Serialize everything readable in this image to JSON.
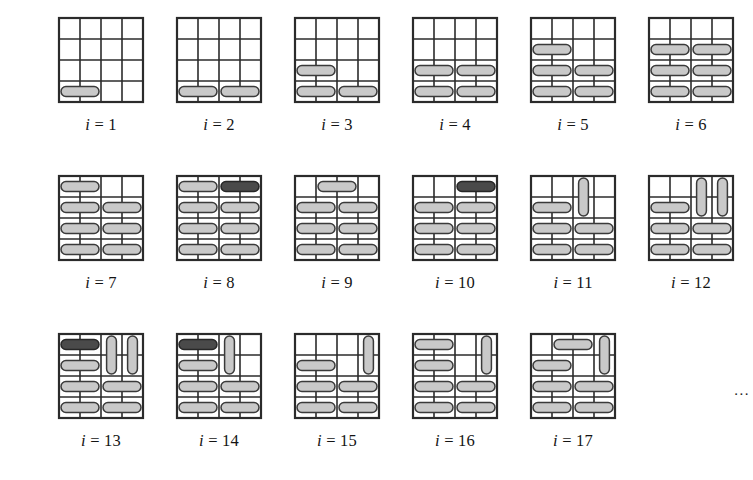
{
  "figure": {
    "grid": {
      "rows": 4,
      "cols": 4,
      "cell_size": 21,
      "line_color": "#2b2b2b",
      "line_width": 1.6,
      "border_width": 2.2,
      "background": "#ffffff"
    },
    "colors": {
      "domino_light_fill": "#c9c9c9",
      "domino_light_stroke": "#3a3a3a",
      "domino_dark_fill": "#4a4a4a",
      "domino_dark_stroke": "#262626",
      "grid_line": "#2b2b2b",
      "text": "#141414",
      "page_background": "#ffffff"
    },
    "label_prefix": "i",
    "label_separator": "=",
    "continuation": "...",
    "layout": {
      "rows": [
        {
          "top": 14,
          "left": 42,
          "gap": 118
        },
        {
          "top": 172,
          "left": 42,
          "gap": 118
        },
        {
          "top": 330,
          "left": 42,
          "gap": 118
        }
      ]
    },
    "panels": [
      {
        "id": "panel-1",
        "index": 1,
        "label": "i = 1",
        "label_value": "1",
        "domino_count": 1,
        "dominoes": [
          {
            "row": 4,
            "col": 1,
            "orient": "h",
            "shade": "light"
          }
        ]
      },
      {
        "id": "panel-2",
        "index": 2,
        "label": "i = 2",
        "label_value": "2",
        "domino_count": 2,
        "dominoes": [
          {
            "row": 4,
            "col": 1,
            "orient": "h",
            "shade": "light"
          },
          {
            "row": 4,
            "col": 3,
            "orient": "h",
            "shade": "light"
          }
        ]
      },
      {
        "id": "panel-3",
        "index": 3,
        "label": "i = 3",
        "label_value": "3",
        "domino_count": 3,
        "dominoes": [
          {
            "row": 3,
            "col": 1,
            "orient": "h",
            "shade": "light"
          },
          {
            "row": 4,
            "col": 1,
            "orient": "h",
            "shade": "light"
          },
          {
            "row": 4,
            "col": 3,
            "orient": "h",
            "shade": "light"
          }
        ]
      },
      {
        "id": "panel-4",
        "index": 4,
        "label": "i = 4",
        "label_value": "4",
        "domino_count": 4,
        "dominoes": [
          {
            "row": 3,
            "col": 1,
            "orient": "h",
            "shade": "light"
          },
          {
            "row": 3,
            "col": 3,
            "orient": "h",
            "shade": "light"
          },
          {
            "row": 4,
            "col": 1,
            "orient": "h",
            "shade": "light"
          },
          {
            "row": 4,
            "col": 3,
            "orient": "h",
            "shade": "light"
          }
        ]
      },
      {
        "id": "panel-5",
        "index": 5,
        "label": "i = 5",
        "label_value": "5",
        "domino_count": 5,
        "dominoes": [
          {
            "row": 2,
            "col": 1,
            "orient": "h",
            "shade": "light"
          },
          {
            "row": 3,
            "col": 1,
            "orient": "h",
            "shade": "light"
          },
          {
            "row": 3,
            "col": 3,
            "orient": "h",
            "shade": "light"
          },
          {
            "row": 4,
            "col": 1,
            "orient": "h",
            "shade": "light"
          },
          {
            "row": 4,
            "col": 3,
            "orient": "h",
            "shade": "light"
          }
        ]
      },
      {
        "id": "panel-6",
        "index": 6,
        "label": "i = 6",
        "label_value": "6",
        "domino_count": 6,
        "dominoes": [
          {
            "row": 2,
            "col": 1,
            "orient": "h",
            "shade": "light"
          },
          {
            "row": 2,
            "col": 3,
            "orient": "h",
            "shade": "light"
          },
          {
            "row": 3,
            "col": 1,
            "orient": "h",
            "shade": "light"
          },
          {
            "row": 3,
            "col": 3,
            "orient": "h",
            "shade": "light"
          },
          {
            "row": 4,
            "col": 1,
            "orient": "h",
            "shade": "light"
          },
          {
            "row": 4,
            "col": 3,
            "orient": "h",
            "shade": "light"
          }
        ]
      },
      {
        "id": "panel-7",
        "index": 7,
        "label": "i = 7",
        "label_value": "7",
        "domino_count": 7,
        "dominoes": [
          {
            "row": 1,
            "col": 1,
            "orient": "h",
            "shade": "light"
          },
          {
            "row": 2,
            "col": 1,
            "orient": "h",
            "shade": "light"
          },
          {
            "row": 2,
            "col": 3,
            "orient": "h",
            "shade": "light"
          },
          {
            "row": 3,
            "col": 1,
            "orient": "h",
            "shade": "light"
          },
          {
            "row": 3,
            "col": 3,
            "orient": "h",
            "shade": "light"
          },
          {
            "row": 4,
            "col": 1,
            "orient": "h",
            "shade": "light"
          },
          {
            "row": 4,
            "col": 3,
            "orient": "h",
            "shade": "light"
          }
        ]
      },
      {
        "id": "panel-8",
        "index": 8,
        "label": "i = 8",
        "label_value": "8",
        "domino_count": 8,
        "dominoes": [
          {
            "row": 1,
            "col": 1,
            "orient": "h",
            "shade": "light"
          },
          {
            "row": 1,
            "col": 3,
            "orient": "h",
            "shade": "dark"
          },
          {
            "row": 2,
            "col": 1,
            "orient": "h",
            "shade": "light"
          },
          {
            "row": 2,
            "col": 3,
            "orient": "h",
            "shade": "light"
          },
          {
            "row": 3,
            "col": 1,
            "orient": "h",
            "shade": "light"
          },
          {
            "row": 3,
            "col": 3,
            "orient": "h",
            "shade": "light"
          },
          {
            "row": 4,
            "col": 1,
            "orient": "h",
            "shade": "light"
          },
          {
            "row": 4,
            "col": 3,
            "orient": "h",
            "shade": "light"
          }
        ]
      },
      {
        "id": "panel-9",
        "index": 9,
        "label": "i = 9",
        "label_value": "9",
        "domino_count": 7,
        "dominoes": [
          {
            "row": 1,
            "col": 2,
            "orient": "h",
            "shade": "light"
          },
          {
            "row": 2,
            "col": 1,
            "orient": "h",
            "shade": "light"
          },
          {
            "row": 2,
            "col": 3,
            "orient": "h",
            "shade": "light"
          },
          {
            "row": 3,
            "col": 1,
            "orient": "h",
            "shade": "light"
          },
          {
            "row": 3,
            "col": 3,
            "orient": "h",
            "shade": "light"
          },
          {
            "row": 4,
            "col": 1,
            "orient": "h",
            "shade": "light"
          },
          {
            "row": 4,
            "col": 3,
            "orient": "h",
            "shade": "light"
          }
        ]
      },
      {
        "id": "panel-10",
        "index": 10,
        "label": "i = 10",
        "label_value": "10",
        "domino_count": 7,
        "dominoes": [
          {
            "row": 1,
            "col": 3,
            "orient": "h",
            "shade": "dark"
          },
          {
            "row": 2,
            "col": 1,
            "orient": "h",
            "shade": "light"
          },
          {
            "row": 2,
            "col": 3,
            "orient": "h",
            "shade": "light"
          },
          {
            "row": 3,
            "col": 1,
            "orient": "h",
            "shade": "light"
          },
          {
            "row": 3,
            "col": 3,
            "orient": "h",
            "shade": "light"
          },
          {
            "row": 4,
            "col": 1,
            "orient": "h",
            "shade": "light"
          },
          {
            "row": 4,
            "col": 3,
            "orient": "h",
            "shade": "light"
          }
        ]
      },
      {
        "id": "panel-11",
        "index": 11,
        "label": "i = 11",
        "label_value": "11",
        "domino_count": 6,
        "dominoes": [
          {
            "row": 1,
            "col": 3,
            "orient": "v",
            "shade": "light"
          },
          {
            "row": 2,
            "col": 1,
            "orient": "h",
            "shade": "light"
          },
          {
            "row": 3,
            "col": 1,
            "orient": "h",
            "shade": "light"
          },
          {
            "row": 3,
            "col": 3,
            "orient": "h",
            "shade": "light"
          },
          {
            "row": 4,
            "col": 1,
            "orient": "h",
            "shade": "light"
          },
          {
            "row": 4,
            "col": 3,
            "orient": "h",
            "shade": "light"
          }
        ]
      },
      {
        "id": "panel-12",
        "index": 12,
        "label": "i = 12",
        "label_value": "12",
        "domino_count": 7,
        "dominoes": [
          {
            "row": 1,
            "col": 3,
            "orient": "v",
            "shade": "light"
          },
          {
            "row": 1,
            "col": 4,
            "orient": "v",
            "shade": "light"
          },
          {
            "row": 2,
            "col": 1,
            "orient": "h",
            "shade": "light"
          },
          {
            "row": 3,
            "col": 1,
            "orient": "h",
            "shade": "light"
          },
          {
            "row": 3,
            "col": 3,
            "orient": "h",
            "shade": "light"
          },
          {
            "row": 4,
            "col": 1,
            "orient": "h",
            "shade": "light"
          },
          {
            "row": 4,
            "col": 3,
            "orient": "h",
            "shade": "light"
          }
        ]
      },
      {
        "id": "panel-13",
        "index": 13,
        "label": "i = 13",
        "label_value": "13",
        "domino_count": 8,
        "dominoes": [
          {
            "row": 1,
            "col": 1,
            "orient": "h",
            "shade": "dark"
          },
          {
            "row": 1,
            "col": 3,
            "orient": "v",
            "shade": "light"
          },
          {
            "row": 1,
            "col": 4,
            "orient": "v",
            "shade": "light"
          },
          {
            "row": 2,
            "col": 1,
            "orient": "h",
            "shade": "light"
          },
          {
            "row": 3,
            "col": 1,
            "orient": "h",
            "shade": "light"
          },
          {
            "row": 3,
            "col": 3,
            "orient": "h",
            "shade": "light"
          },
          {
            "row": 4,
            "col": 1,
            "orient": "h",
            "shade": "light"
          },
          {
            "row": 4,
            "col": 3,
            "orient": "h",
            "shade": "light"
          }
        ]
      },
      {
        "id": "panel-14",
        "index": 14,
        "label": "i = 14",
        "label_value": "14",
        "domino_count": 7,
        "dominoes": [
          {
            "row": 1,
            "col": 1,
            "orient": "h",
            "shade": "dark"
          },
          {
            "row": 1,
            "col": 3,
            "orient": "v",
            "shade": "light"
          },
          {
            "row": 2,
            "col": 1,
            "orient": "h",
            "shade": "light"
          },
          {
            "row": 3,
            "col": 1,
            "orient": "h",
            "shade": "light"
          },
          {
            "row": 3,
            "col": 3,
            "orient": "h",
            "shade": "light"
          },
          {
            "row": 4,
            "col": 1,
            "orient": "h",
            "shade": "light"
          },
          {
            "row": 4,
            "col": 3,
            "orient": "h",
            "shade": "light"
          }
        ]
      },
      {
        "id": "panel-15",
        "index": 15,
        "label": "i = 15",
        "label_value": "15",
        "domino_count": 6,
        "dominoes": [
          {
            "row": 1,
            "col": 4,
            "orient": "v",
            "shade": "light"
          },
          {
            "row": 2,
            "col": 1,
            "orient": "h",
            "shade": "light"
          },
          {
            "row": 3,
            "col": 1,
            "orient": "h",
            "shade": "light"
          },
          {
            "row": 3,
            "col": 3,
            "orient": "h",
            "shade": "light"
          },
          {
            "row": 4,
            "col": 1,
            "orient": "h",
            "shade": "light"
          },
          {
            "row": 4,
            "col": 3,
            "orient": "h",
            "shade": "light"
          }
        ]
      },
      {
        "id": "panel-16",
        "index": 16,
        "label": "i = 16",
        "label_value": "16",
        "domino_count": 7,
        "dominoes": [
          {
            "row": 1,
            "col": 1,
            "orient": "h",
            "shade": "light"
          },
          {
            "row": 1,
            "col": 4,
            "orient": "v",
            "shade": "light"
          },
          {
            "row": 2,
            "col": 1,
            "orient": "h",
            "shade": "light"
          },
          {
            "row": 3,
            "col": 1,
            "orient": "h",
            "shade": "light"
          },
          {
            "row": 3,
            "col": 3,
            "orient": "h",
            "shade": "light"
          },
          {
            "row": 4,
            "col": 1,
            "orient": "h",
            "shade": "light"
          },
          {
            "row": 4,
            "col": 3,
            "orient": "h",
            "shade": "light"
          }
        ]
      },
      {
        "id": "panel-17",
        "index": 17,
        "label": "i = 17",
        "label_value": "17",
        "domino_count": 7,
        "dominoes": [
          {
            "row": 1,
            "col": 2,
            "orient": "h",
            "shade": "light"
          },
          {
            "row": 1,
            "col": 4,
            "orient": "v",
            "shade": "light"
          },
          {
            "row": 2,
            "col": 1,
            "orient": "h",
            "shade": "light"
          },
          {
            "row": 3,
            "col": 1,
            "orient": "h",
            "shade": "light"
          },
          {
            "row": 3,
            "col": 3,
            "orient": "h",
            "shade": "light"
          },
          {
            "row": 4,
            "col": 1,
            "orient": "h",
            "shade": "light"
          },
          {
            "row": 4,
            "col": 3,
            "orient": "h",
            "shade": "light"
          }
        ]
      }
    ],
    "row_groups": [
      {
        "name": "figure-row-1",
        "panel_ids": [
          "panel-1",
          "panel-2",
          "panel-3",
          "panel-4",
          "panel-5",
          "panel-6"
        ],
        "has_ellipsis": false
      },
      {
        "name": "figure-row-2",
        "panel_ids": [
          "panel-7",
          "panel-8",
          "panel-9",
          "panel-10",
          "panel-11",
          "panel-12"
        ],
        "has_ellipsis": false
      },
      {
        "name": "figure-row-3",
        "panel_ids": [
          "panel-13",
          "panel-14",
          "panel-15",
          "panel-16",
          "panel-17"
        ],
        "has_ellipsis": true
      }
    ]
  }
}
